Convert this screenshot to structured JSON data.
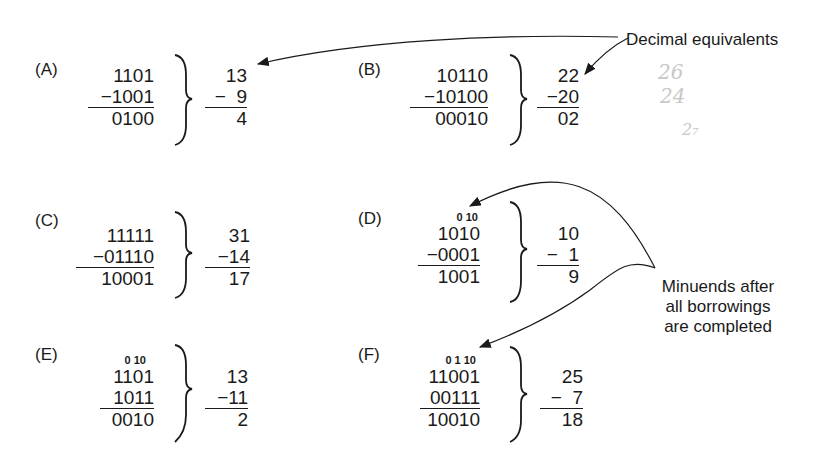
{
  "annotations": {
    "decimal_equivalents": "Decimal equivalents",
    "minuends_line1": "Minuends after",
    "minuends_line2": "all borrowings",
    "minuends_line3": "are completed"
  },
  "handwriting": [
    "26",
    "24",
    "2",
    "2₇"
  ],
  "examples": [
    {
      "label": "(A)",
      "borrow": "",
      "minuend": "1101",
      "subtrahend": "−1001",
      "difference": "0100",
      "dec_minuend": "13",
      "dec_subtrahend": "−  9",
      "dec_difference": "4"
    },
    {
      "label": "(B)",
      "borrow": "",
      "minuend": "10110",
      "subtrahend": "−10100",
      "difference": "00010",
      "dec_minuend": "22",
      "dec_subtrahend": "−20",
      "dec_difference": "02"
    },
    {
      "label": "(C)",
      "borrow": "",
      "minuend": "11111",
      "subtrahend": "−01110",
      "difference": "10001",
      "dec_minuend": "31",
      "dec_subtrahend": "−14",
      "dec_difference": "17"
    },
    {
      "label": "(D)",
      "borrow": "0 10",
      "minuend": "1010",
      "subtrahend": "−0001",
      "difference": "1001",
      "dec_minuend": "10",
      "dec_subtrahend": "−  1",
      "dec_difference": "9"
    },
    {
      "label": "(E)",
      "borrow": "0 10",
      "minuend": "1101",
      "subtrahend": "1011",
      "difference": "0010",
      "dec_minuend": "13",
      "dec_subtrahend": "−11",
      "dec_difference": "2"
    },
    {
      "label": "(F)",
      "borrow": "0 1 10",
      "minuend": "11001",
      "subtrahend": "00111",
      "difference": "10010",
      "dec_minuend": "25",
      "dec_subtrahend": "−  7",
      "dec_difference": "18"
    }
  ]
}
